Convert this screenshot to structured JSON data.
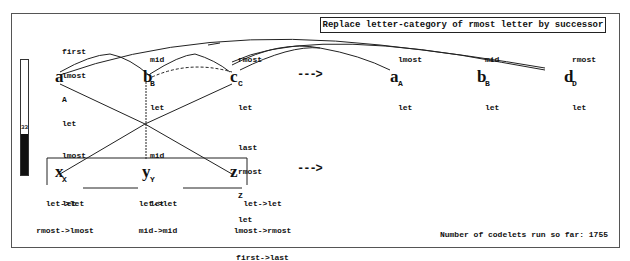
{
  "rule": "Replace letter-category of rmost letter by successor",
  "temperature": {
    "value": "33",
    "percent": 36
  },
  "initial": {
    "letters": [
      "a",
      "b",
      "c"
    ],
    "descriptions": [
      [
        "first",
        "lmost",
        "A",
        "let"
      ],
      [
        "mid",
        "B",
        "let"
      ],
      [
        "rmost",
        "C",
        "let"
      ]
    ]
  },
  "modified": {
    "letters": [
      "a",
      "b",
      "d"
    ],
    "descriptions": [
      [
        "lmost",
        "A",
        "let"
      ],
      [
        "mid",
        "B",
        "let"
      ],
      [
        "rmost",
        "D",
        "let"
      ]
    ]
  },
  "target": {
    "letters": [
      "x",
      "y",
      "z"
    ],
    "descriptions": [
      [
        "lmost",
        "X",
        "let"
      ],
      [
        "mid",
        "Y",
        "let"
      ],
      [
        "last",
        "rmost",
        "Z",
        "let"
      ]
    ]
  },
  "mappings": [
    [
      "let->let",
      "rmost->lmost"
    ],
    [
      "let->let",
      "mid->mid"
    ],
    [
      "let->let",
      "lmost->rmost",
      "first->last"
    ]
  ],
  "arrows": [
    "--->",
    "--->"
  ],
  "status": "Number of codelets run so far: 1755"
}
